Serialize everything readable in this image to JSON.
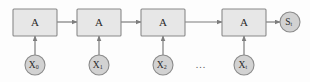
{
  "figure": {
    "type": "diagram",
    "name": "unrolled-recurrent-network",
    "background_color": "#fdfdfd",
    "box_fill": "#e7e7e7",
    "box_stroke": "#8a8a8a",
    "circle_fill": "#d2d2d2",
    "circle_stroke": "#8a8a8a",
    "arrow_color": "#7d7d7d",
    "text_color": "#2b2b2b"
  },
  "cells": [
    {
      "label": "A",
      "x": 13,
      "y": 9,
      "w": 44,
      "h": 27
    },
    {
      "label": "A",
      "x": 77,
      "y": 9,
      "w": 44,
      "h": 27
    },
    {
      "label": "A",
      "x": 141,
      "y": 9,
      "w": 44,
      "h": 27
    },
    {
      "label": "A",
      "x": 222,
      "y": 9,
      "w": 44,
      "h": 27
    }
  ],
  "inputs": [
    {
      "base": "X",
      "subscript": "0",
      "cx": 35,
      "cy": 65,
      "r": 10
    },
    {
      "base": "X",
      "subscript": "1",
      "cx": 99,
      "cy": 65,
      "r": 10
    },
    {
      "base": "X",
      "subscript": "2",
      "cx": 163,
      "cy": 65,
      "r": 10
    },
    {
      "base": "X",
      "subscript": "t",
      "cx": 244,
      "cy": 65,
      "r": 10
    }
  ],
  "output": {
    "base": "S",
    "subscript": "t",
    "cx": 290,
    "cy": 22,
    "r": 10
  },
  "ellipsis": {
    "label": "...",
    "cx": 201,
    "cy": 66
  },
  "horizontal_arrows": [
    {
      "x1": 57,
      "x2": 77,
      "y": 22
    },
    {
      "x1": 121,
      "x2": 141,
      "y": 22
    },
    {
      "x1": 185,
      "x2": 222,
      "y": 22
    },
    {
      "x1": 266,
      "x2": 280,
      "y": 22
    }
  ],
  "vertical_arrows": [
    {
      "x": 35,
      "y1": 55,
      "y2": 36
    },
    {
      "x": 99,
      "y1": 55,
      "y2": 36
    },
    {
      "x": 163,
      "y1": 55,
      "y2": 36
    },
    {
      "x": 244,
      "y1": 55,
      "y2": 36
    }
  ]
}
